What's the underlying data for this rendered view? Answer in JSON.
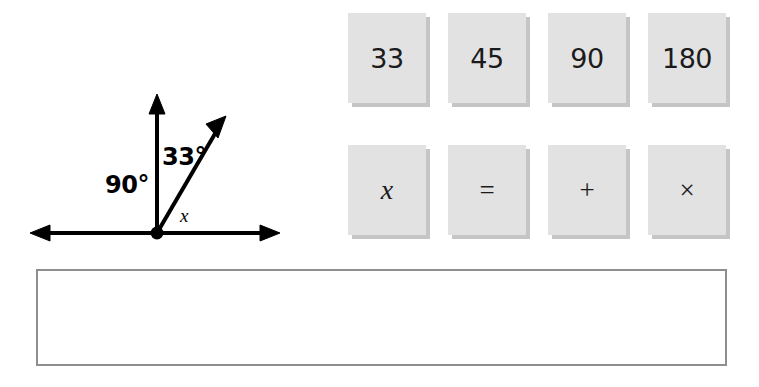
{
  "figure": {
    "name": "angle-diagram",
    "vertex_label": "",
    "labels": {
      "right_angle": "90°",
      "given_angle": "33°",
      "unknown_angle": "x"
    },
    "rays": [
      {
        "name": "horizontal-line",
        "direction": "double-arrow-horizontal"
      },
      {
        "name": "vertical-ray",
        "direction": "up-arrow"
      },
      {
        "name": "diagonal-ray",
        "direction": "up-right-arrow"
      }
    ],
    "stroke_color": "#000000"
  },
  "tile_bank": {
    "name": "answer-tile-bank",
    "rows": [
      {
        "name": "number-tiles",
        "tiles": [
          {
            "label": "33",
            "kind": "number"
          },
          {
            "label": "45",
            "kind": "number"
          },
          {
            "label": "90",
            "kind": "number"
          },
          {
            "label": "180",
            "kind": "number"
          }
        ]
      },
      {
        "name": "symbol-tiles",
        "tiles": [
          {
            "label": "x",
            "kind": "variable"
          },
          {
            "label": "=",
            "kind": "operator"
          },
          {
            "label": "+",
            "kind": "operator"
          },
          {
            "label": "×",
            "kind": "operator"
          }
        ]
      }
    ],
    "tile_fill": "#e2e2e2",
    "tile_shadow": "#969696"
  },
  "answer_area": {
    "name": "answer-drop-zone",
    "value": "",
    "placeholder": "",
    "border_color": "#8e8e8e"
  }
}
